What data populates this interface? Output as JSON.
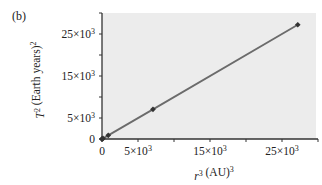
{
  "chart_data": {
    "type": "line",
    "panel_label": "(b)",
    "title": "",
    "xlabel": "r³ (AU)³",
    "ylabel": "T² (Earth years)²",
    "xlim": [
      0,
      30000
    ],
    "ylim": [
      0,
      30000
    ],
    "x_ticks": [
      0,
      5000,
      10000,
      15000,
      20000,
      25000,
      30000
    ],
    "x_tick_labels": [
      "0",
      "5×10³",
      "",
      "15×10³",
      "",
      "25×10³",
      ""
    ],
    "y_ticks": [
      0,
      5000,
      10000,
      15000,
      20000,
      25000,
      30000
    ],
    "y_tick_labels": [
      "0",
      "5×10³",
      "",
      "15×10³",
      "",
      "25×10³",
      ""
    ],
    "grid": false,
    "background": "#ececec",
    "line_color": "#6b6b6b",
    "marker_color": "#333333",
    "series": [
      {
        "name": "planets",
        "x": [
          0,
          1,
          3.5,
          141,
          868,
          7078,
          27190
        ],
        "y": [
          0,
          1,
          3.5,
          141,
          868,
          7060,
          27200
        ]
      }
    ]
  }
}
